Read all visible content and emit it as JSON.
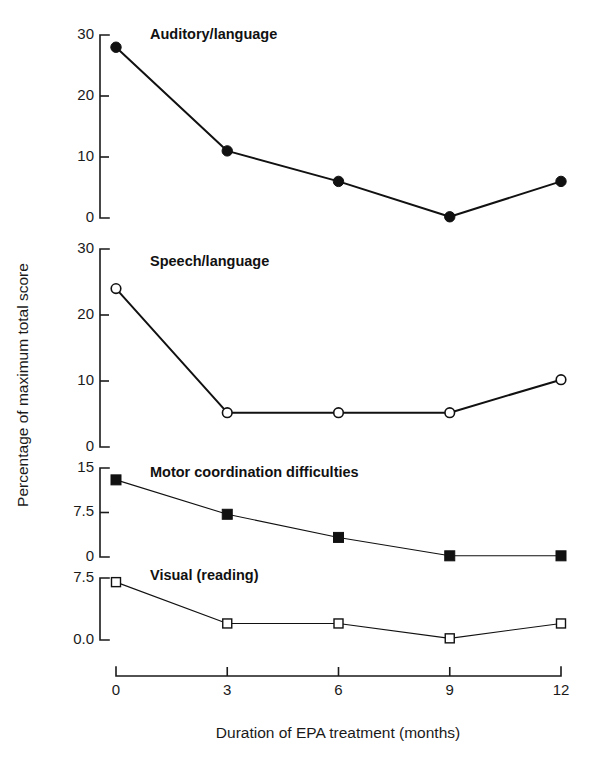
{
  "chart_data": {
    "type": "line",
    "title": "",
    "xlabel": "Duration of EPA treatment (months)",
    "ylabel": "Percentage of maximum total score",
    "x": [
      0,
      3,
      6,
      9,
      12
    ],
    "xticklabels": [
      "0",
      "3",
      "6",
      "9",
      "12"
    ],
    "xlim": [
      0,
      12
    ],
    "grid": false,
    "legend_position": "inline-panel-title",
    "panels": [
      {
        "name": "Auditory/language",
        "marker": "filled-circle",
        "line_weight": "thick",
        "ylim": [
          0,
          30
        ],
        "yticks": [
          0,
          10,
          20,
          30
        ],
        "yticklabels": [
          "0",
          "10",
          "20",
          "30"
        ],
        "values": [
          28,
          11,
          6,
          0.2,
          6
        ]
      },
      {
        "name": "Speech/language",
        "marker": "open-circle",
        "line_weight": "thick",
        "ylim": [
          0,
          30
        ],
        "yticks": [
          0,
          10,
          20,
          30
        ],
        "yticklabels": [
          "0",
          "10",
          "20",
          "30"
        ],
        "values": [
          24,
          5.2,
          5.2,
          5.2,
          10.2
        ]
      },
      {
        "name": "Motor coordination difficulties",
        "marker": "filled-square",
        "line_weight": "thin",
        "ylim": [
          0,
          15
        ],
        "yticks": [
          0,
          7.5,
          15
        ],
        "yticklabels": [
          "0",
          "7.5",
          "15"
        ],
        "values": [
          13,
          7.2,
          3.3,
          0.2,
          0.2
        ]
      },
      {
        "name": "Visual (reading)",
        "marker": "open-square",
        "line_weight": "thin",
        "ylim": [
          0,
          7.5
        ],
        "yticks": [
          0,
          7.5
        ],
        "yticklabels": [
          "0.0",
          "7.5"
        ],
        "values": [
          7.0,
          2.0,
          2.0,
          0.2,
          2.0
        ]
      }
    ]
  },
  "colors": {
    "ink": "#111111",
    "background": "#ffffff"
  }
}
